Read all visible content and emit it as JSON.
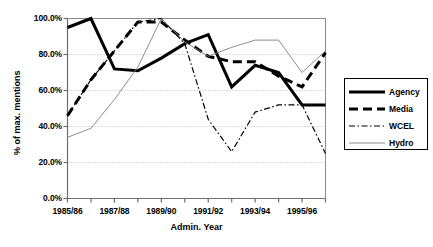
{
  "chart_data": {
    "type": "line",
    "title": "",
    "xlabel": "Admin. Year",
    "ylabel": "% of max. mentions",
    "ylim": [
      0,
      100
    ],
    "ytick_labels": [
      "0.0%",
      "20.0%",
      "40.0%",
      "60.0%",
      "80.0%",
      "100.0%"
    ],
    "ytick_values": [
      0,
      20,
      40,
      60,
      80,
      100
    ],
    "grid": "horizontal-dotted",
    "legend_position": "right",
    "x": [
      "1985/86",
      "1986/87",
      "1987/88",
      "1988/89",
      "1989/90",
      "1990/91",
      "1991/92",
      "1992/93",
      "1993/94",
      "1994/95",
      "1995/96",
      "1996/97"
    ],
    "xtick_labels_shown": [
      "1985/86",
      "1987/88",
      "1989/90",
      "1991/92",
      "1993/94",
      "1995/96"
    ],
    "series": [
      {
        "name": "Agency",
        "style": "thick-solid",
        "color": "#000000",
        "values": [
          95,
          100,
          72,
          71,
          78,
          86,
          91,
          62,
          74,
          70,
          52,
          52
        ]
      },
      {
        "name": "Media",
        "style": "thick-dashed",
        "color": "#000000",
        "values": [
          46,
          66,
          82,
          98,
          98,
          88,
          79,
          76,
          76,
          68,
          62,
          81
        ]
      },
      {
        "name": "WCEL",
        "style": "thin-dash-dot",
        "color": "#000000",
        "values": [
          46,
          66,
          82,
          98,
          100,
          86,
          44,
          26,
          48,
          52,
          52,
          25
        ]
      },
      {
        "name": "Hydro",
        "style": "thin-solid",
        "color": "#808080",
        "values": [
          34,
          39,
          55,
          73,
          100,
          87,
          79,
          84,
          88,
          88,
          70,
          82
        ]
      }
    ]
  },
  "legend": {
    "items": [
      {
        "label": "Agency"
      },
      {
        "label": "Media"
      },
      {
        "label": "WCEL"
      },
      {
        "label": "Hydro"
      }
    ]
  }
}
